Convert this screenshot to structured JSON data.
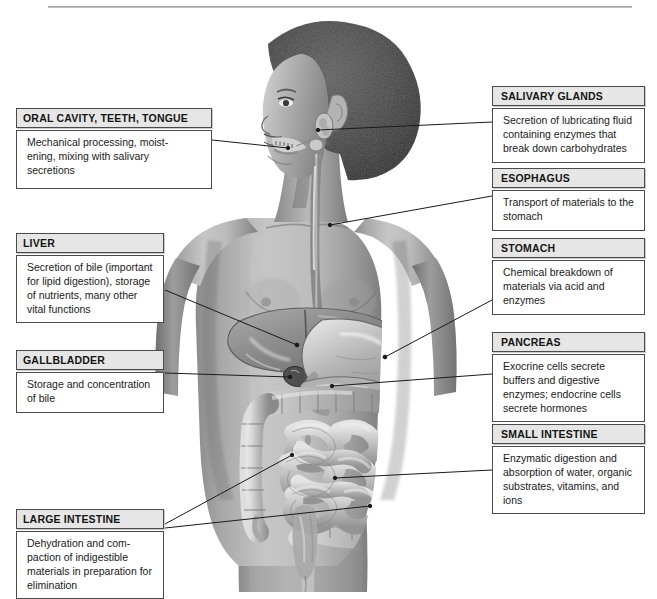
{
  "figure": {
    "alt_description": "Grayscale medical illustration of a standing human figure with the digestive tract organs shown in the abdomen",
    "style": "grayscale anatomical airbrush illustration",
    "colors": {
      "box_border": "#4a4a4a",
      "header_fill": "#e6e6e6",
      "body_fill": "#ffffff",
      "leader_line": "#1a1a1a",
      "skin_mid": "#9a9a9a",
      "skin_light": "#c8c8c8",
      "skin_dark": "#6e6e6e",
      "hair_dark": "#3a3a3a",
      "organ_light": "#d2d2d2",
      "organ_mid": "#a5a5a5",
      "organ_dark": "#7a7a7a",
      "background": "#ffffff"
    }
  },
  "labels_left": [
    {
      "id": "oral",
      "title": "ORAL CAVITY, TEETH,  TONGUE",
      "text": "Mechanical processing, moist-ening, mixing with salivary secretions"
    },
    {
      "id": "liver",
      "title": "LIVER",
      "text": "Secretion of bile (important for lipid digestion), storage of nutrients, many other vital functions"
    },
    {
      "id": "gallbladder",
      "title": "GALLBLADDER",
      "text": "Storage and concentration of bile"
    },
    {
      "id": "large-intestine",
      "title": "LARGE INTESTINE",
      "text": "Dehydration and com-paction of indigestible materials in preparation for elimination"
    }
  ],
  "labels_right": [
    {
      "id": "salivary-glands",
      "title": "SALIVARY GLANDS",
      "text": "Secretion of lubricating fluid containing enzymes that break down carbohydrates"
    },
    {
      "id": "esophagus",
      "title": "ESOPHAGUS",
      "text": "Transport of materials to the stomach"
    },
    {
      "id": "stomach",
      "title": "STOMACH",
      "text": "Chemical breakdown of materials via acid and enzymes"
    },
    {
      "id": "pancreas",
      "title": "PANCREAS",
      "text": "Exocrine cells secrete buffers and digestive enzymes; endocrine cells secrete hormones"
    },
    {
      "id": "small-intestine",
      "title": "SMALL INTESTINE",
      "text": "Enzymatic digestion and absorption of water, organic substrates, vitamins, and ions"
    }
  ],
  "label_text_lines": {
    "oral": [
      "Mechanical processing, moist-",
      "ening, mixing with salivary",
      "secretions"
    ],
    "liver": [
      "Secretion of bile (important",
      "for lipid digestion), storage",
      "of nutrients, many other",
      "vital functions"
    ],
    "gallbladder": [
      "Storage and concentration",
      "of bile"
    ],
    "large-intestine": [
      "Dehydration and com-",
      "paction of indigestible",
      "materials in preparation for",
      "elimination"
    ],
    "salivary-glands": [
      "Secretion of lubricating fluid",
      "containing enzymes that",
      "break down carbohydrates"
    ],
    "esophagus": [
      "Transport of materials to the",
      "stomach"
    ],
    "stomach": [
      "Chemical breakdown of",
      "materials via acid and",
      "enzymes"
    ],
    "pancreas": [
      "Exocrine cells secrete",
      "buffers and digestive",
      "enzymes; endocrine cells",
      "secrete hormones"
    ],
    "small-intestine": [
      "Enzymatic digestion and",
      "absorption of water, organic",
      "substrates, vitamins, and",
      "ions"
    ]
  },
  "leader_lines": [
    {
      "id": "leader-oral",
      "from": [
        212,
        140
      ],
      "to": [
        288,
        148
      ],
      "target": "oral cavity / teeth"
    },
    {
      "id": "leader-liver",
      "from": [
        165,
        290
      ],
      "to": [
        297,
        345
      ],
      "target": "liver"
    },
    {
      "id": "leader-gallbladder",
      "from": [
        165,
        373
      ],
      "to": [
        290,
        377
      ],
      "target": "gallbladder"
    },
    {
      "id": "leader-large-intestine-a",
      "from": [
        165,
        524
      ],
      "to": [
        292,
        455
      ],
      "target": "ascending colon"
    },
    {
      "id": "leader-large-intestine-b",
      "from": [
        165,
        528
      ],
      "to": [
        370,
        506
      ],
      "target": "descending colon"
    },
    {
      "id": "leader-salivary",
      "from": [
        492,
        122
      ],
      "to": [
        318,
        130
      ],
      "target": "salivary gland"
    },
    {
      "id": "leader-esophagus",
      "from": [
        492,
        196
      ],
      "to": [
        330,
        225
      ],
      "target": "esophagus"
    },
    {
      "id": "leader-stomach",
      "from": [
        492,
        300
      ],
      "to": [
        385,
        357
      ],
      "target": "stomach"
    },
    {
      "id": "leader-pancreas",
      "from": [
        492,
        374
      ],
      "to": [
        332,
        386
      ],
      "target": "pancreas"
    },
    {
      "id": "leader-small-intestine",
      "from": [
        492,
        470
      ],
      "to": [
        335,
        478
      ],
      "target": "small intestine"
    }
  ]
}
